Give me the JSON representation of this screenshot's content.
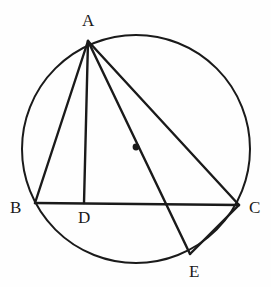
{
  "figure": {
    "kind": "circle-geometry-diagram",
    "background_color": "#fefefe",
    "stroke_color": "#1a1a1a",
    "label_color": "#1a1a1a",
    "width": 271,
    "height": 287,
    "circle": {
      "center_x": 136,
      "center_y": 149,
      "radius": 114,
      "stroke_width": 2.0
    },
    "center_dot": {
      "x": 136,
      "y": 147,
      "radius": 3.4
    },
    "points": {
      "A": {
        "x": 88,
        "y": 41
      },
      "B": {
        "x": 35,
        "y": 203
      },
      "C": {
        "x": 239,
        "y": 205
      },
      "D": {
        "x": 84,
        "y": 203
      },
      "E": {
        "x": 190,
        "y": 254
      }
    },
    "segments": [
      {
        "name": "segment-AB",
        "from": "A",
        "to": "B"
      },
      {
        "name": "segment-AD",
        "from": "A",
        "to": "D"
      },
      {
        "name": "segment-AE",
        "from": "A",
        "to": "E"
      },
      {
        "name": "segment-AC",
        "from": "A",
        "to": "C"
      },
      {
        "name": "segment-BC",
        "from": "B",
        "to": "C"
      },
      {
        "name": "segment-EC",
        "from": "E",
        "to": "C"
      }
    ],
    "labels": [
      {
        "name": "vertex-label-A",
        "text": "A",
        "x": 82,
        "y": 12
      },
      {
        "name": "vertex-label-B",
        "text": "B",
        "x": 10,
        "y": 199
      },
      {
        "name": "vertex-label-C",
        "text": "C",
        "x": 249,
        "y": 199
      },
      {
        "name": "vertex-label-D",
        "text": "D",
        "x": 78,
        "y": 209
      },
      {
        "name": "vertex-label-E",
        "text": "E",
        "x": 189,
        "y": 263
      }
    ]
  }
}
